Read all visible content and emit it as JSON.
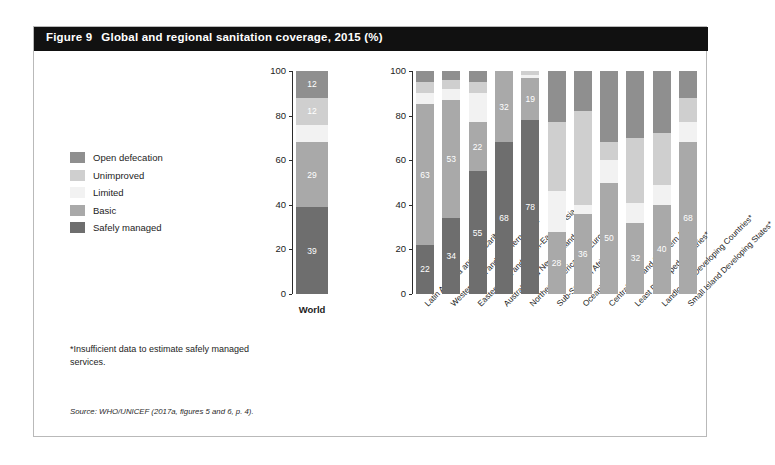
{
  "figure": {
    "number": "Figure 9",
    "title": "Global and regional sanitation coverage, 2015 (%)",
    "footnote": "*Insufficient data to estimate safely managed services.",
    "source": "Source: WHO/UNICEF (2017a, figures 5 and 6, p. 4)."
  },
  "legend": {
    "items": [
      {
        "label": "Open defecation",
        "color": "#8f8f8f"
      },
      {
        "label": "Unimproved",
        "color": "#cfcfcf"
      },
      {
        "label": "Limited",
        "color": "#f2f2f2"
      },
      {
        "label": "Basic",
        "color": "#a9a9a9"
      },
      {
        "label": "Safely managed",
        "color": "#6e6e6e"
      }
    ]
  },
  "chart_data": {
    "type": "bar",
    "subtype": "stacked-100",
    "title": "Global and regional sanitation coverage, 2015 (%)",
    "xlabel": "",
    "ylabel": "",
    "ylim": [
      0,
      100
    ],
    "yticks": [
      0,
      20,
      40,
      60,
      80,
      100
    ],
    "grid": false,
    "legend_position": "left",
    "stack_order_bottom_to_top": [
      "Safely managed",
      "Basic",
      "Limited",
      "Unimproved",
      "Open defecation"
    ],
    "series": [
      {
        "name": "Safely managed",
        "color": "#6e6e6e"
      },
      {
        "name": "Basic",
        "color": "#a9a9a9"
      },
      {
        "name": "Limited",
        "color": "#f2f2f2"
      },
      {
        "name": "Unimproved",
        "color": "#cfcfcf"
      },
      {
        "name": "Open defecation",
        "color": "#8f8f8f"
      }
    ],
    "panels": [
      {
        "name": "world",
        "categories": [
          "World"
        ],
        "bars": [
          {
            "category": "World",
            "asterisk": false,
            "segments": [
              {
                "series": "Safely managed",
                "value": 39,
                "label": "39"
              },
              {
                "series": "Basic",
                "value": 29,
                "label": "29"
              },
              {
                "series": "Limited",
                "value": 8,
                "label": ""
              },
              {
                "series": "Unimproved",
                "value": 12,
                "label": "12"
              },
              {
                "series": "Open defecation",
                "value": 12,
                "label": "12"
              }
            ]
          }
        ]
      },
      {
        "name": "regions",
        "categories": [
          "Latin America and the Caribbean",
          "Western Asia and Northern Africa",
          "Eastern Asia and South-Eastern Asia",
          "Australia and New Zealand",
          "Northern America and Europe",
          "Sub-Saharan Africa*",
          "Oceania*",
          "Central Asia and Southern Asia*",
          "Least Developed Countries*",
          "Landlocked Developing Countries*",
          "Small Island Developing States*"
        ],
        "bars": [
          {
            "category": "Latin America and the Caribbean",
            "asterisk": false,
            "segments": [
              {
                "series": "Safely managed",
                "value": 22,
                "label": "22"
              },
              {
                "series": "Basic",
                "value": 63,
                "label": "63"
              },
              {
                "series": "Limited",
                "value": 5,
                "label": ""
              },
              {
                "series": "Unimproved",
                "value": 5,
                "label": ""
              },
              {
                "series": "Open defecation",
                "value": 5,
                "label": ""
              }
            ]
          },
          {
            "category": "Western Asia and Northern Africa",
            "asterisk": false,
            "segments": [
              {
                "series": "Safely managed",
                "value": 34,
                "label": "34"
              },
              {
                "series": "Basic",
                "value": 53,
                "label": "53"
              },
              {
                "series": "Limited",
                "value": 5,
                "label": ""
              },
              {
                "series": "Unimproved",
                "value": 4,
                "label": ""
              },
              {
                "series": "Open defecation",
                "value": 4,
                "label": ""
              }
            ]
          },
          {
            "category": "Eastern Asia and South-Eastern Asia",
            "asterisk": false,
            "segments": [
              {
                "series": "Safely managed",
                "value": 55,
                "label": "55"
              },
              {
                "series": "Basic",
                "value": 22,
                "label": "22"
              },
              {
                "series": "Limited",
                "value": 13,
                "label": ""
              },
              {
                "series": "Unimproved",
                "value": 5,
                "label": ""
              },
              {
                "series": "Open defecation",
                "value": 5,
                "label": ""
              }
            ]
          },
          {
            "category": "Australia and New Zealand",
            "asterisk": false,
            "segments": [
              {
                "series": "Safely managed",
                "value": 68,
                "label": "68"
              },
              {
                "series": "Basic",
                "value": 32,
                "label": "32"
              },
              {
                "series": "Limited",
                "value": 0,
                "label": ""
              },
              {
                "series": "Unimproved",
                "value": 0,
                "label": ""
              },
              {
                "series": "Open defecation",
                "value": 0,
                "label": ""
              }
            ]
          },
          {
            "category": "Northern America and Europe",
            "asterisk": false,
            "segments": [
              {
                "series": "Safely managed",
                "value": 78,
                "label": "78"
              },
              {
                "series": "Basic",
                "value": 19,
                "label": "19"
              },
              {
                "series": "Limited",
                "value": 1,
                "label": ""
              },
              {
                "series": "Unimproved",
                "value": 2,
                "label": ""
              },
              {
                "series": "Open defecation",
                "value": 0,
                "label": ""
              }
            ]
          },
          {
            "category": "Sub-Saharan Africa*",
            "asterisk": true,
            "segments": [
              {
                "series": "Safely managed",
                "value": 0,
                "label": ""
              },
              {
                "series": "Basic",
                "value": 28,
                "label": "28"
              },
              {
                "series": "Limited",
                "value": 18,
                "label": ""
              },
              {
                "series": "Unimproved",
                "value": 31,
                "label": ""
              },
              {
                "series": "Open defecation",
                "value": 23,
                "label": ""
              }
            ]
          },
          {
            "category": "Oceania*",
            "asterisk": true,
            "segments": [
              {
                "series": "Safely managed",
                "value": 0,
                "label": ""
              },
              {
                "series": "Basic",
                "value": 36,
                "label": "36"
              },
              {
                "series": "Limited",
                "value": 4,
                "label": ""
              },
              {
                "series": "Unimproved",
                "value": 42,
                "label": ""
              },
              {
                "series": "Open defecation",
                "value": 18,
                "label": ""
              }
            ]
          },
          {
            "category": "Central Asia and Southern Asia*",
            "asterisk": true,
            "segments": [
              {
                "series": "Safely managed",
                "value": 0,
                "label": ""
              },
              {
                "series": "Basic",
                "value": 50,
                "label": "50"
              },
              {
                "series": "Limited",
                "value": 10,
                "label": ""
              },
              {
                "series": "Unimproved",
                "value": 8,
                "label": ""
              },
              {
                "series": "Open defecation",
                "value": 32,
                "label": ""
              }
            ]
          },
          {
            "category": "Least Developed Countries*",
            "asterisk": true,
            "segments": [
              {
                "series": "Safely managed",
                "value": 0,
                "label": ""
              },
              {
                "series": "Basic",
                "value": 32,
                "label": "32"
              },
              {
                "series": "Limited",
                "value": 9,
                "label": ""
              },
              {
                "series": "Unimproved",
                "value": 29,
                "label": ""
              },
              {
                "series": "Open defecation",
                "value": 30,
                "label": ""
              }
            ]
          },
          {
            "category": "Landlocked Developing Countries*",
            "asterisk": true,
            "segments": [
              {
                "series": "Safely managed",
                "value": 0,
                "label": ""
              },
              {
                "series": "Basic",
                "value": 40,
                "label": "40"
              },
              {
                "series": "Limited",
                "value": 9,
                "label": ""
              },
              {
                "series": "Unimproved",
                "value": 23,
                "label": ""
              },
              {
                "series": "Open defecation",
                "value": 28,
                "label": ""
              }
            ]
          },
          {
            "category": "Small Island Developing States*",
            "asterisk": true,
            "segments": [
              {
                "series": "Safely managed",
                "value": 0,
                "label": ""
              },
              {
                "series": "Basic",
                "value": 68,
                "label": "68"
              },
              {
                "series": "Limited",
                "value": 9,
                "label": ""
              },
              {
                "series": "Unimproved",
                "value": 11,
                "label": ""
              },
              {
                "series": "Open defecation",
                "value": 12,
                "label": ""
              }
            ]
          }
        ]
      }
    ]
  }
}
